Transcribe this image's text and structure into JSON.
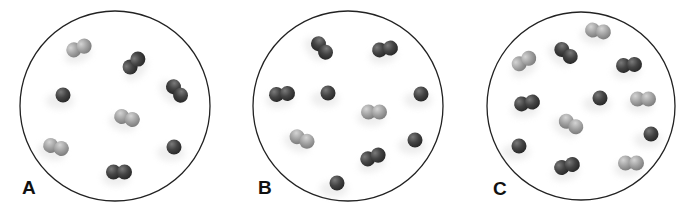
{
  "colors": {
    "dark": "#3e3e3e",
    "dark_hi": "#7a7a7a",
    "light": "#9c9c9c",
    "light_hi": "#d2d2d2",
    "outline": "#222222"
  },
  "panels": [
    {
      "label": "A",
      "label_pos": [
        22,
        178
      ],
      "circle": {
        "cx": 115,
        "cy": 106,
        "r": 95
      },
      "particles": [
        {
          "type": "diatomic",
          "shade": "light",
          "x": 79,
          "y": 48,
          "angle": -20
        },
        {
          "type": "diatomic",
          "shade": "dark",
          "x": 134,
          "y": 63,
          "angle": -45
        },
        {
          "type": "single",
          "shade": "dark",
          "x": 63,
          "y": 95
        },
        {
          "type": "diatomic",
          "shade": "dark",
          "x": 177,
          "y": 91,
          "angle": 50
        },
        {
          "type": "diatomic",
          "shade": "light",
          "x": 127,
          "y": 118,
          "angle": 15
        },
        {
          "type": "diatomic",
          "shade": "light",
          "x": 56,
          "y": 147,
          "angle": 15
        },
        {
          "type": "single",
          "shade": "dark",
          "x": 174,
          "y": 147
        },
        {
          "type": "diatomic",
          "shade": "dark",
          "x": 119,
          "y": 172,
          "angle": 0
        }
      ]
    },
    {
      "label": "B",
      "label_pos": [
        258,
        178
      ],
      "circle": {
        "cx": 348,
        "cy": 106,
        "r": 95
      },
      "particles": [
        {
          "type": "diatomic",
          "shade": "dark",
          "x": 322,
          "y": 48,
          "angle": 50
        },
        {
          "type": "diatomic",
          "shade": "dark",
          "x": 385,
          "y": 49,
          "angle": -10
        },
        {
          "type": "diatomic",
          "shade": "dark",
          "x": 282,
          "y": 94,
          "angle": -5
        },
        {
          "type": "single",
          "shade": "dark",
          "x": 328,
          "y": 93
        },
        {
          "type": "single",
          "shade": "dark",
          "x": 421,
          "y": 94
        },
        {
          "type": "diatomic",
          "shade": "light",
          "x": 374,
          "y": 112,
          "angle": 0
        },
        {
          "type": "diatomic",
          "shade": "light",
          "x": 302,
          "y": 139,
          "angle": 25
        },
        {
          "type": "single",
          "shade": "dark",
          "x": 415,
          "y": 140
        },
        {
          "type": "diatomic",
          "shade": "dark",
          "x": 373,
          "y": 157,
          "angle": -20
        },
        {
          "type": "single",
          "shade": "dark",
          "x": 337,
          "y": 183
        }
      ]
    },
    {
      "label": "C",
      "label_pos": [
        493,
        179
      ],
      "circle": {
        "cx": 581,
        "cy": 106,
        "r": 94
      },
      "particles": [
        {
          "type": "diatomic",
          "shade": "light",
          "x": 598,
          "y": 31,
          "angle": 10
        },
        {
          "type": "diatomic",
          "shade": "light",
          "x": 524,
          "y": 61,
          "angle": -30
        },
        {
          "type": "diatomic",
          "shade": "dark",
          "x": 566,
          "y": 53,
          "angle": 40
        },
        {
          "type": "diatomic",
          "shade": "dark",
          "x": 629,
          "y": 65,
          "angle": -5
        },
        {
          "type": "diatomic",
          "shade": "dark",
          "x": 527,
          "y": 103,
          "angle": -10
        },
        {
          "type": "single",
          "shade": "dark",
          "x": 600,
          "y": 98
        },
        {
          "type": "diatomic",
          "shade": "light",
          "x": 643,
          "y": 99,
          "angle": 0
        },
        {
          "type": "diatomic",
          "shade": "light",
          "x": 571,
          "y": 124,
          "angle": 30
        },
        {
          "type": "single",
          "shade": "dark",
          "x": 651,
          "y": 134
        },
        {
          "type": "single",
          "shade": "dark",
          "x": 519,
          "y": 146
        },
        {
          "type": "diatomic",
          "shade": "dark",
          "x": 567,
          "y": 166,
          "angle": -15
        },
        {
          "type": "diatomic",
          "shade": "light",
          "x": 631,
          "y": 163,
          "angle": 0
        }
      ]
    }
  ]
}
